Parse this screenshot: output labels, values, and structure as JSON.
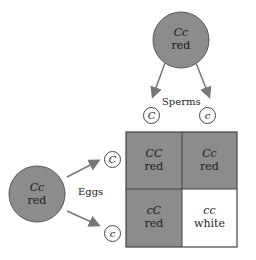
{
  "colors": {
    "dominant_fill": "#8c8c8c",
    "recessive_fill": "#ffffff",
    "line": "#444444",
    "arrow": "#777777"
  },
  "male_parent": {
    "genotype": "Cc",
    "phenotype": "red"
  },
  "female_parent": {
    "genotype": "Cc",
    "phenotype": "red"
  },
  "labels": {
    "sperms": "Sperms",
    "eggs": "Eggs"
  },
  "sperm_alleles": [
    "C",
    "c"
  ],
  "egg_alleles": [
    "C",
    "c"
  ],
  "punnett": {
    "cells": [
      {
        "genotype": "CC",
        "phenotype": "red"
      },
      {
        "genotype": "Cc",
        "phenotype": "red"
      },
      {
        "genotype": "cC",
        "phenotype": "red"
      },
      {
        "genotype": "cc",
        "phenotype": "white"
      }
    ]
  }
}
